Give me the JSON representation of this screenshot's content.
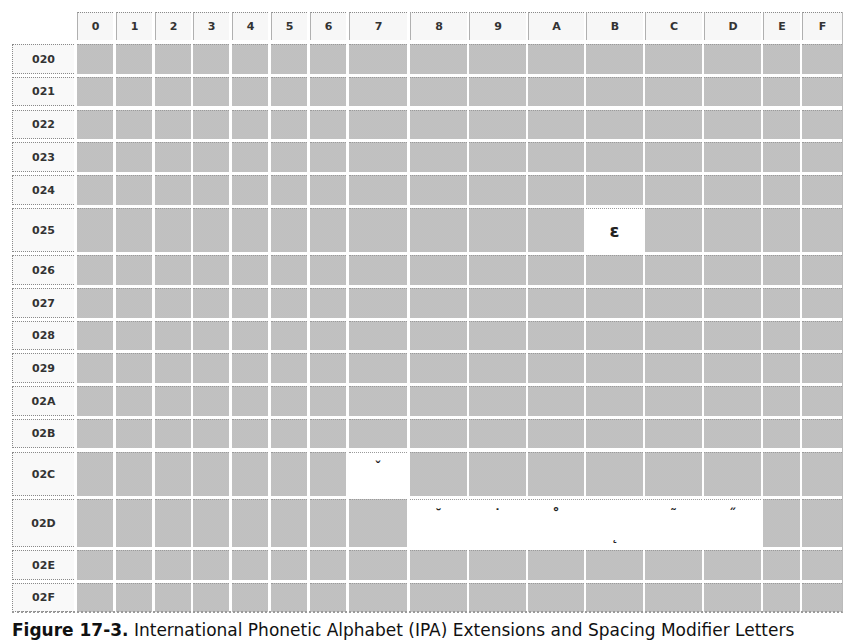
{
  "table": {
    "columns": [
      "0",
      "1",
      "2",
      "3",
      "4",
      "5",
      "6",
      "7",
      "8",
      "9",
      "A",
      "B",
      "C",
      "D",
      "E",
      "F"
    ],
    "rows": [
      "020",
      "021",
      "022",
      "023",
      "024",
      "025",
      "026",
      "027",
      "028",
      "029",
      "02A",
      "02B",
      "02C",
      "02D",
      "02E",
      "02F"
    ],
    "defined_cells": [
      {
        "row": "025",
        "col": "B",
        "glyph": "ɛ",
        "codepoint": "025B",
        "position": "middle",
        "size": 18
      },
      {
        "row": "02C",
        "col": "7",
        "glyph": "ˇ",
        "codepoint": "02C7",
        "position": "top",
        "size": 14
      },
      {
        "row": "02D",
        "col": "8",
        "glyph": "˘",
        "codepoint": "02D8",
        "position": "top",
        "size": 14
      },
      {
        "row": "02D",
        "col": "9",
        "glyph": "˙",
        "codepoint": "02D9",
        "position": "top",
        "size": 14
      },
      {
        "row": "02D",
        "col": "A",
        "glyph": "˚",
        "codepoint": "02DA",
        "position": "top",
        "size": 16
      },
      {
        "row": "02D",
        "col": "B",
        "glyph": "˛",
        "codepoint": "02DB",
        "position": "bottom",
        "size": 14
      },
      {
        "row": "02D",
        "col": "C",
        "glyph": "˜",
        "codepoint": "02DC",
        "position": "top",
        "size": 14
      },
      {
        "row": "02D",
        "col": "D",
        "glyph": "˝",
        "codepoint": "02DD",
        "position": "top",
        "size": 14
      }
    ],
    "colors": {
      "undefined_cell": "#c9c9c9",
      "defined_cell": "#ffffff",
      "header_bg": "#f7f7f7"
    }
  },
  "caption": {
    "label": "Figure 17-3.",
    "text": "International Phonetic Alphabet (IPA) Extensions and Spacing Modifier Letters"
  }
}
